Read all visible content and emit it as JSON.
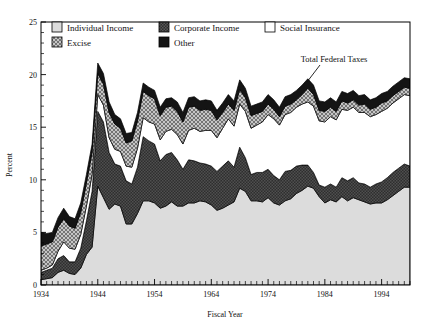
{
  "chart_data": {
    "type": "area",
    "title": "",
    "xlabel": "Fiscal Year",
    "ylabel": "Percent",
    "xlim": [
      1934,
      1999
    ],
    "ylim": [
      0,
      25
    ],
    "yticks": [
      0,
      5,
      10,
      15,
      20,
      25
    ],
    "xticks": [
      1934,
      1944,
      1954,
      1964,
      1974,
      1984,
      1994
    ],
    "grid": false,
    "stacked": true,
    "legend_position": "top-inside",
    "annotations": [
      {
        "text": "Total Federal Taxes",
        "x": 1981,
        "y": 21.3,
        "leader_to_x": 1979,
        "leader_to_y": 18.6
      }
    ],
    "x": [
      1934,
      1935,
      1936,
      1937,
      1938,
      1939,
      1940,
      1941,
      1942,
      1943,
      1944,
      1945,
      1946,
      1947,
      1948,
      1949,
      1950,
      1951,
      1952,
      1953,
      1954,
      1955,
      1956,
      1957,
      1958,
      1959,
      1960,
      1961,
      1962,
      1963,
      1964,
      1965,
      1966,
      1967,
      1968,
      1969,
      1970,
      1971,
      1972,
      1973,
      1974,
      1975,
      1976,
      1977,
      1978,
      1979,
      1980,
      1981,
      1982,
      1983,
      1984,
      1985,
      1986,
      1987,
      1988,
      1989,
      1990,
      1991,
      1992,
      1993,
      1994,
      1995,
      1996,
      1997,
      1998,
      1999
    ],
    "series": [
      {
        "name": "Individual Income",
        "swatch": "light-gray-solid",
        "color": "#dcdcdc",
        "values": [
          0.5,
          0.6,
          0.7,
          1.2,
          1.4,
          1.1,
          1.0,
          1.6,
          2.9,
          3.6,
          9.4,
          8.3,
          7.2,
          7.7,
          7.5,
          5.8,
          5.8,
          6.8,
          8.0,
          8.0,
          7.8,
          7.3,
          7.5,
          7.9,
          7.5,
          7.5,
          7.8,
          7.8,
          8.0,
          7.9,
          7.6,
          7.1,
          7.3,
          7.6,
          7.9,
          9.2,
          8.9,
          8.0,
          8.0,
          7.9,
          8.3,
          7.8,
          7.6,
          8.0,
          8.2,
          8.7,
          9.0,
          9.4,
          9.2,
          8.4,
          7.8,
          8.1,
          7.9,
          8.4,
          8.0,
          8.3,
          8.1,
          7.9,
          7.7,
          7.8,
          7.8,
          8.1,
          8.5,
          8.9,
          9.3,
          9.3
        ]
      },
      {
        "name": "Corporate Income",
        "swatch": "dark-checker",
        "color": "#3a3a3a",
        "values": [
          0.7,
          0.8,
          0.9,
          1.3,
          1.4,
          1.1,
          1.2,
          1.9,
          3.2,
          5.3,
          7.1,
          7.2,
          5.4,
          3.8,
          3.8,
          4.1,
          3.8,
          4.4,
          6.1,
          5.7,
          5.6,
          4.5,
          4.9,
          4.7,
          4.4,
          3.5,
          4.1,
          4.0,
          3.6,
          3.6,
          3.7,
          3.7,
          4.0,
          4.2,
          3.3,
          3.9,
          3.2,
          2.5,
          2.7,
          2.8,
          2.7,
          2.6,
          2.4,
          2.8,
          2.7,
          2.6,
          2.4,
          2.0,
          1.5,
          1.1,
          1.5,
          1.5,
          1.4,
          1.8,
          1.9,
          1.9,
          1.6,
          1.7,
          1.6,
          1.8,
          2.0,
          2.1,
          2.2,
          2.2,
          2.2,
          2.0
        ]
      },
      {
        "name": "Social Insurance",
        "swatch": "white-solid",
        "color": "#ffffff",
        "values": [
          0.2,
          0.2,
          0.3,
          0.7,
          1.3,
          1.3,
          1.2,
          1.3,
          1.4,
          1.6,
          1.6,
          1.6,
          1.4,
          1.4,
          1.4,
          1.4,
          1.6,
          1.8,
          1.8,
          1.8,
          1.9,
          2.0,
          2.2,
          2.2,
          2.4,
          2.4,
          2.8,
          3.1,
          3.0,
          3.2,
          3.4,
          3.2,
          3.6,
          4.0,
          3.9,
          4.1,
          4.4,
          4.4,
          4.5,
          4.8,
          5.2,
          5.4,
          5.2,
          5.4,
          5.5,
          5.6,
          5.8,
          6.0,
          6.3,
          6.1,
          6.2,
          6.4,
          6.4,
          6.5,
          6.7,
          6.7,
          6.7,
          6.8,
          6.7,
          6.6,
          6.7,
          6.6,
          6.6,
          6.6,
          6.6,
          6.7
        ]
      },
      {
        "name": "Excise",
        "swatch": "gray-crosshatch",
        "color": "#b4b4b4",
        "values": [
          2.3,
          2.3,
          2.2,
          2.3,
          2.2,
          2.1,
          2.0,
          2.1,
          2.2,
          2.1,
          2.0,
          2.0,
          2.4,
          2.4,
          2.2,
          2.2,
          2.5,
          2.6,
          2.5,
          2.5,
          2.4,
          2.3,
          2.3,
          2.2,
          2.2,
          2.1,
          2.2,
          2.1,
          2.0,
          2.0,
          1.9,
          1.7,
          1.5,
          1.4,
          1.5,
          1.4,
          1.3,
          1.2,
          1.1,
          1.0,
          1.0,
          0.9,
          0.8,
          0.8,
          0.8,
          0.7,
          0.9,
          1.3,
          1.1,
          1.0,
          1.0,
          0.9,
          0.8,
          0.8,
          0.7,
          0.7,
          0.7,
          0.8,
          0.7,
          0.7,
          0.8,
          0.7,
          0.7,
          0.7,
          0.7,
          0.7
        ]
      },
      {
        "name": "Other",
        "swatch": "black-solid",
        "color": "#111111",
        "values": [
          1.3,
          1.0,
          0.9,
          0.9,
          1.0,
          0.9,
          0.9,
          0.9,
          0.8,
          0.8,
          1.0,
          1.0,
          1.0,
          0.9,
          0.9,
          0.9,
          0.8,
          0.8,
          0.8,
          0.8,
          0.8,
          0.8,
          0.8,
          0.8,
          0.9,
          0.9,
          0.9,
          0.9,
          0.9,
          0.9,
          0.9,
          0.9,
          0.9,
          0.9,
          0.9,
          0.9,
          0.9,
          0.9,
          0.9,
          0.9,
          0.9,
          0.9,
          0.9,
          0.9,
          0.9,
          0.9,
          0.9,
          0.9,
          0.9,
          0.9,
          0.9,
          0.9,
          0.9,
          0.9,
          0.9,
          0.9,
          0.9,
          0.9,
          0.9,
          0.9,
          0.9,
          0.9,
          0.9,
          0.9,
          0.9,
          0.9
        ]
      }
    ]
  },
  "legend": {
    "items": [
      {
        "label": "Individual Income",
        "swatch": "light-gray-solid"
      },
      {
        "label": "Corporate Income",
        "swatch": "dark-checker"
      },
      {
        "label": "Social Insurance",
        "swatch": "white-solid"
      },
      {
        "label": "Excise",
        "swatch": "gray-crosshatch"
      },
      {
        "label": "Other",
        "swatch": "black-solid"
      }
    ]
  },
  "axes": {
    "y_title": "Percent",
    "x_title": "Fiscal Year",
    "y_ticks": [
      "0",
      "5",
      "10",
      "15",
      "20",
      "25"
    ],
    "x_ticks": [
      "1934",
      "1944",
      "1954",
      "1964",
      "1974",
      "1984",
      "1994"
    ]
  },
  "annotation": {
    "total_federal_taxes": "Total Federal Taxes"
  }
}
